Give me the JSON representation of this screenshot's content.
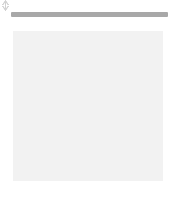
{
  "figure": {
    "title": "",
    "background_color": "#ffffff"
  },
  "palette": {
    "dark_cell": "#636363",
    "light_cell": "#c8c8c8",
    "rail": "#a8a8a8",
    "marker": "#d2d2d2",
    "grid_line": "#f2f2f2",
    "edge_shadow": "#9e9e9e"
  },
  "top_rail": {
    "label": "",
    "color": "#a8a8a8"
  },
  "bottom_rail": {
    "label": "",
    "color": "#a8a8a8"
  },
  "top_markers": [
    {
      "name": "top-marker-1",
      "direction": "down",
      "x": 35,
      "label": ""
    },
    {
      "name": "top-marker-2",
      "direction": "down",
      "x": 89,
      "label": ""
    },
    {
      "name": "top-marker-3",
      "direction": "down",
      "x": 142,
      "label": ""
    }
  ],
  "bottom_markers": [
    {
      "name": "bottom-marker-1",
      "direction": "up",
      "x": 35,
      "label": ""
    },
    {
      "name": "bottom-marker-2",
      "direction": "up",
      "x": 89,
      "label": ""
    },
    {
      "name": "bottom-marker-3",
      "direction": "up",
      "x": 142,
      "label": ""
    }
  ],
  "chart_data": {
    "type": "heatmap",
    "title": "",
    "xlabel": "",
    "ylabel": "",
    "rows": 6,
    "cols": 6,
    "grid": true,
    "legend": "none",
    "xticklabels": [],
    "yticklabels": [],
    "colorscale": {
      "0": "#c8c8c8",
      "1": "#636363"
    },
    "values": [
      [
        1,
        1,
        0,
        0,
        1,
        1
      ],
      [
        1,
        1,
        0,
        0,
        1,
        1
      ],
      [
        0,
        0,
        1,
        1,
        0,
        0
      ],
      [
        0,
        0,
        1,
        1,
        0,
        0
      ],
      [
        1,
        1,
        0,
        0,
        1,
        1
      ],
      [
        1,
        1,
        0,
        0,
        1,
        1
      ]
    ]
  }
}
